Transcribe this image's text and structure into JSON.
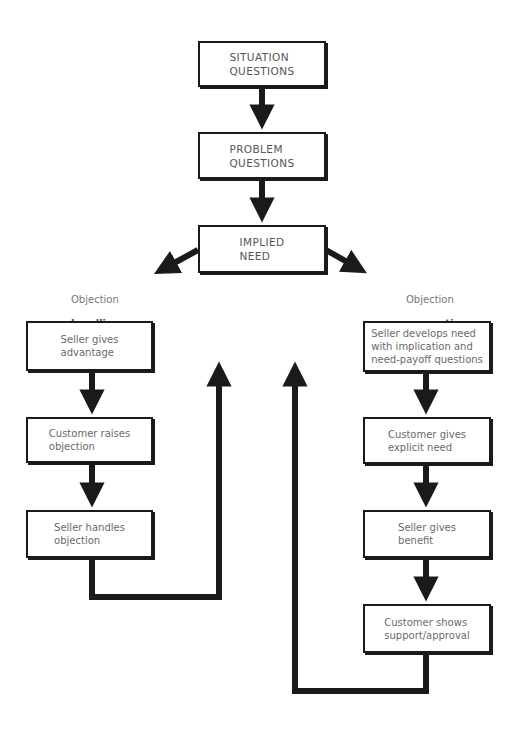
{
  "diagram": {
    "type": "flowchart",
    "top_chain": [
      {
        "id": "situation",
        "label": "SITUATION\nQUESTIONS"
      },
      {
        "id": "problem",
        "label": "PROBLEM\nQUESTIONS"
      },
      {
        "id": "implied",
        "label": "IMPLIED\nNEED"
      }
    ],
    "left_branch": {
      "caption": {
        "line1": "Objection",
        "line2": "handling",
        "line3": "strategy"
      },
      "steps": [
        {
          "id": "seller-advantage",
          "label": "Seller gives\nadvantage"
        },
        {
          "id": "customer-objection",
          "label": "Customer raises\nobjection"
        },
        {
          "id": "seller-handles",
          "label": "Seller handles\nobjection"
        }
      ]
    },
    "right_branch": {
      "caption": {
        "line1": "Objection",
        "line2": "prevention",
        "line3": "strategy"
      },
      "steps": [
        {
          "id": "seller-develops",
          "label": "Seller develops need\nwith implication and\nneed-payoff questions"
        },
        {
          "id": "customer-explicit",
          "label": "Customer gives\nexplicit need"
        },
        {
          "id": "seller-benefit",
          "label": "Seller gives\nbenefit"
        },
        {
          "id": "customer-support",
          "label": "Customer shows\nsupport/approval"
        }
      ]
    },
    "colors": {
      "line": "#1a1a1a",
      "text": "#6a6a6a",
      "background": "#ffffff"
    }
  }
}
